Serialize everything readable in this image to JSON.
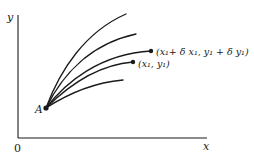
{
  "diagram": {
    "axes": {
      "origin_label": "0",
      "x_label": "x",
      "y_label": "y"
    },
    "start_point": {
      "label": "A"
    },
    "points": {
      "p1": {
        "label": "(x₁, y₁)"
      },
      "p2": {
        "label": "(x₁+ δ x₁, y₁ + δ y₁)"
      }
    },
    "curve_count": 5,
    "colors": {
      "ink": "#1a1a1a",
      "background": "#ffffff"
    }
  }
}
